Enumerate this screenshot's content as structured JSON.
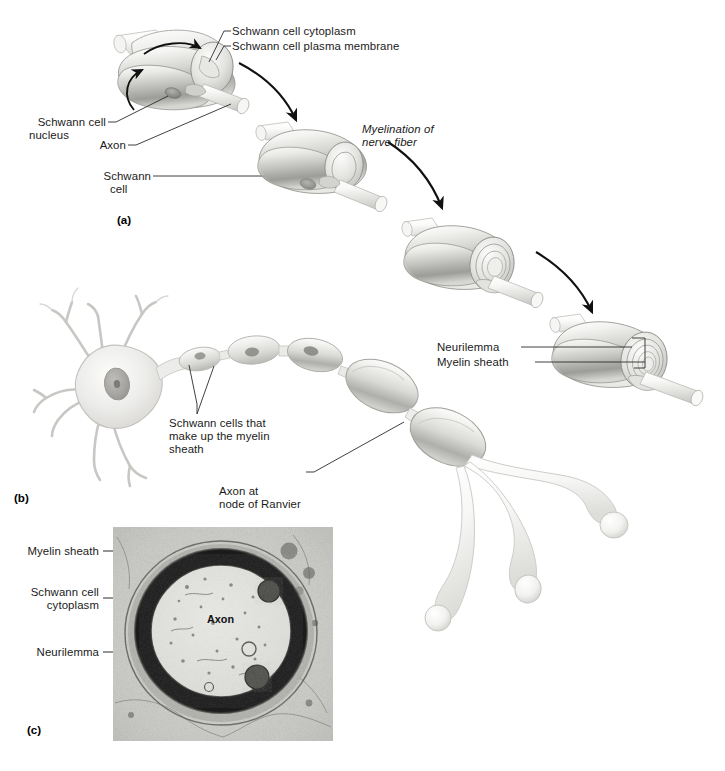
{
  "figure": {
    "title_text": "",
    "panels": [
      {
        "id": "a",
        "id_label": "(a)",
        "description": "Myelination of a nerve fiber by a Schwann cell, shown in four sequential stages of wrapping",
        "labels": [
          {
            "name": "schwann-cell-cytoplasm",
            "text": "Schwann cell cytoplasm"
          },
          {
            "name": "schwann-cell-plasma-membrane",
            "text": "Schwann cell plasma membrane"
          },
          {
            "name": "schwann-cell-nucleus",
            "text": "Schwann cell\nnucleus"
          },
          {
            "name": "axon",
            "text": "Axon"
          },
          {
            "name": "schwann-cell",
            "text": "Schwann\ncell"
          },
          {
            "name": "myelination-of-nerve-fiber",
            "text": "Myelination of\nnerve fiber"
          },
          {
            "name": "neurilemma",
            "text": "Neurilemma"
          },
          {
            "name": "myelin-sheath",
            "text": "Myelin sheath"
          }
        ]
      },
      {
        "id": "b",
        "id_label": "(b)",
        "description": "A multipolar neuron with cell body, dendrites, and a myelinated axon ending in synaptic knobs",
        "labels": [
          {
            "name": "schwann-cells-myelin-sheath",
            "text": "Schwann cells that\nmake up the myelin\nsheath"
          },
          {
            "name": "axon-node-of-ranvier",
            "text": "Axon at\nnode of Ranvier"
          }
        ]
      },
      {
        "id": "c",
        "id_label": "(c)",
        "description": "Transmission electron micrograph of a cross section through a myelinated axon",
        "labels": [
          {
            "name": "myelin-sheath",
            "text": "Myelin sheath"
          },
          {
            "name": "schwann-cell-cytoplasm",
            "text": "Schwann cell\ncytoplasm"
          },
          {
            "name": "neurilemma",
            "text": "Neurilemma"
          },
          {
            "name": "axon",
            "text": "Axon"
          }
        ]
      }
    ]
  },
  "panel_a": {
    "cytoplasm_label": "Schwann cell cytoplasm",
    "plasma_membrane_label": "Schwann cell plasma membrane",
    "nucleus_label_line1": "Schwann cell",
    "nucleus_label_line2": "nucleus",
    "axon_label": "Axon",
    "schwann_cell_label_line1": "Schwann",
    "schwann_cell_label_line2": "cell",
    "myelination_label_line1": "Myelination of",
    "myelination_label_line2": "nerve fiber",
    "neurilemma_label": "Neurilemma",
    "myelin_sheath_label": "Myelin sheath",
    "panel_id": "(a)"
  },
  "panel_b": {
    "schwann_cells_label_line1": "Schwann cells that",
    "schwann_cells_label_line2": "make up the myelin",
    "schwann_cells_label_line3": "sheath",
    "node_label_line1": "Axon at",
    "node_label_line2": "node of Ranvier",
    "panel_id": "(b)"
  },
  "panel_c": {
    "myelin_sheath_label": "Myelin sheath",
    "schwann_cytoplasm_label_line1": "Schwann cell",
    "schwann_cytoplasm_label_line2": "cytoplasm",
    "neurilemma_label": "Neurilemma",
    "axon_label": "Axon",
    "panel_id": "(c)"
  },
  "colors": {
    "text": "#1a1a1a",
    "leader_line": "#2b2b2b",
    "cell_light": "#f2f2f0",
    "cell_mid": "#c9c9c6",
    "cell_dark": "#8e8e8b",
    "axon_light": "#fbfbfa",
    "neuron_body": "#e6e4e0",
    "micrograph_bg": "#cfcfcb",
    "myelin_dark": "#151515"
  }
}
